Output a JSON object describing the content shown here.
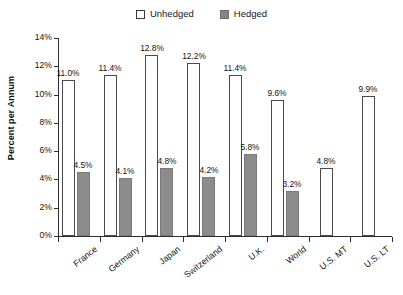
{
  "chart_data": {
    "type": "bar",
    "title": "",
    "subtitle": "",
    "xlabel": "",
    "ylabel": "Percent per Annum",
    "ylim": [
      0,
      14
    ],
    "ytick_labels": [
      "0%",
      "2%",
      "4%",
      "6%",
      "8%",
      "10%",
      "12%",
      "14%"
    ],
    "ytick_values": [
      0,
      2,
      4,
      6,
      8,
      10,
      12,
      14
    ],
    "grid": false,
    "legend_position": "top-center",
    "categories": [
      "France",
      "Germany",
      "Japan",
      "Switzerland",
      "U.K.",
      "World",
      "U.S. MT",
      "U.S. LT"
    ],
    "series": [
      {
        "name": "Unhedged",
        "color": "#ffffff",
        "edge_color": "#4a4a4a",
        "values": [
          11.0,
          11.4,
          12.8,
          12.2,
          11.4,
          9.6,
          4.8,
          9.9
        ],
        "labels": [
          "11.0%",
          "11.4%",
          "12.8%",
          "12.2%",
          "11.4%",
          "9.6%",
          "4.8%",
          "9.9%"
        ]
      },
      {
        "name": "Hedged",
        "color": "#8c8c8c",
        "edge_color": "#7a7a7a",
        "values": [
          4.5,
          4.1,
          4.8,
          4.2,
          5.8,
          3.2,
          null,
          null
        ],
        "labels": [
          "4.5%",
          "4.1%",
          "4.8%",
          "4.2%",
          "5.8%",
          "3.2%",
          "",
          ""
        ]
      }
    ]
  },
  "legend": {
    "entries": [
      {
        "label": "Unhedged",
        "swatch": "open-square-swatch"
      },
      {
        "label": "Hedged",
        "swatch": "filled-square-swatch"
      }
    ]
  },
  "axes": {
    "y_title": "Percent per Annum"
  }
}
